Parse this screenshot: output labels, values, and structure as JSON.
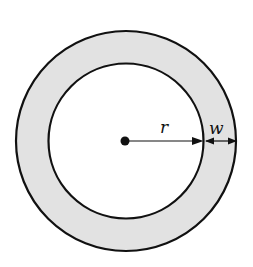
{
  "diagram": {
    "type": "annulus",
    "colors": {
      "ring_fill": "#e2e2e2",
      "inner_fill": "#ffffff",
      "stroke": "#111111",
      "background": "#ffffff"
    },
    "labels": {
      "radius": "r",
      "width": "w"
    }
  }
}
